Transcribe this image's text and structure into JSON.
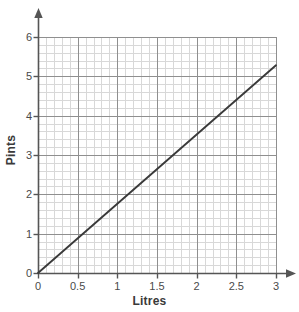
{
  "chart_data": {
    "type": "line",
    "title": "",
    "xlabel": "Litres",
    "ylabel": "Pints",
    "xlim": [
      0,
      3
    ],
    "ylim": [
      0,
      6
    ],
    "xticks": [
      "0",
      "0.5",
      "1",
      "1.5",
      "2",
      "2.5",
      "3"
    ],
    "xtick_values": [
      0,
      0.5,
      1,
      1.5,
      2,
      2.5,
      3
    ],
    "yticks": [
      "0",
      "1",
      "2",
      "3",
      "4",
      "5",
      "6"
    ],
    "ytick_values": [
      0,
      1,
      2,
      3,
      4,
      5,
      6
    ],
    "grid": true,
    "minor_grid": true,
    "x_minor_step": 0.1,
    "y_minor_step": 0.2,
    "legend": "none",
    "series": [
      {
        "name": "Litres to Pints conversion",
        "x": [
          0,
          3
        ],
        "values": [
          0,
          5.28
        ],
        "slope": 1.76,
        "intercept": 0
      }
    ]
  },
  "axes": {
    "x_arrow": "arrow-right",
    "y_arrow": "arrow-up"
  },
  "colors": {
    "line": "#3a3a3a",
    "axis": "#555555",
    "grid_major": "#8f8f8f",
    "grid_minor": "#d8d8d8",
    "text": "#4a4a4a",
    "title_text": "#3a3a3a",
    "background": "#ffffff"
  }
}
